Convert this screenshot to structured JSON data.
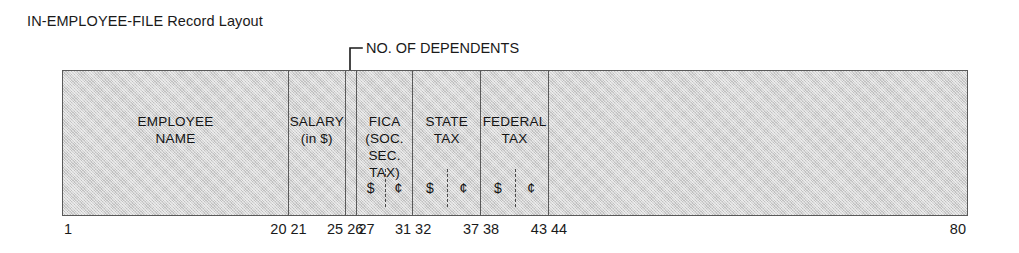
{
  "title": "IN-EMPLOYEE-FILE Record Layout",
  "callout": {
    "label": "NO. OF DEPENDENTS",
    "points_to_field": "no-of-dependents"
  },
  "record": {
    "total_columns": 80,
    "colors": {
      "field_fill": "#d3d3d3",
      "border": "#5a5a5a",
      "text": "#141414",
      "page_background": "#ffffff"
    },
    "fields": [
      {
        "id": "employee-name",
        "name": "EMPLOYEE\nNAME",
        "start": 1,
        "end": 20,
        "money_split": false
      },
      {
        "id": "salary",
        "name": "SALARY\n(in $)",
        "start": 21,
        "end": 25,
        "money_split": false
      },
      {
        "id": "no-of-dependents",
        "name": "",
        "start": 26,
        "end": 26,
        "money_split": false
      },
      {
        "id": "fica",
        "name": "FICA\n(SOC. SEC. TAX)",
        "start": 27,
        "end": 31,
        "money_split": true,
        "dollars_symbol": "$",
        "cents_symbol": "¢"
      },
      {
        "id": "state-tax",
        "name": "STATE\nTAX",
        "start": 32,
        "end": 37,
        "money_split": true,
        "dollars_symbol": "$",
        "cents_symbol": "¢"
      },
      {
        "id": "federal-tax",
        "name": "FEDERAL\nTAX",
        "start": 38,
        "end": 43,
        "money_split": true,
        "dollars_symbol": "$",
        "cents_symbol": "¢"
      },
      {
        "id": "filler",
        "name": "",
        "start": 44,
        "end": 80,
        "money_split": false
      }
    ],
    "ruler_labels": [
      {
        "text": "1",
        "field": 0,
        "side": "start"
      },
      {
        "text": "20",
        "field": 0,
        "side": "end"
      },
      {
        "text": "21",
        "field": 1,
        "side": "start"
      },
      {
        "text": "25",
        "field": 1,
        "side": "end"
      },
      {
        "text": "26",
        "field": 2,
        "side": "start"
      },
      {
        "text": "27",
        "field": 3,
        "side": "start"
      },
      {
        "text": "31",
        "field": 3,
        "side": "end"
      },
      {
        "text": "32",
        "field": 4,
        "side": "start"
      },
      {
        "text": "37",
        "field": 4,
        "side": "end"
      },
      {
        "text": "38",
        "field": 5,
        "side": "start"
      },
      {
        "text": "43",
        "field": 5,
        "side": "end"
      },
      {
        "text": "44",
        "field": 6,
        "side": "start"
      },
      {
        "text": "80",
        "field": 6,
        "side": "end"
      }
    ]
  }
}
